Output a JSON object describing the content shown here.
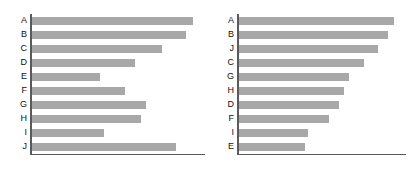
{
  "figure": {
    "background_color": "#ffffff",
    "bar_color": "#a8a8a8",
    "axis_color": "#5a5a5a",
    "label_color": "#111111",
    "panel_count": 2
  },
  "chart_data": [
    {
      "type": "bar",
      "orientation": "horizontal",
      "title": "",
      "subtitle": "",
      "xlabel": "",
      "ylabel": "",
      "legend": [],
      "legend_position": "none",
      "grid": false,
      "sorted": false,
      "sort_order": "category",
      "categories": [
        "A",
        "B",
        "C",
        "D",
        "E",
        "F",
        "G",
        "H",
        "I",
        "J"
      ],
      "values": [
        92.0,
        88.0,
        74.0,
        59.0,
        39.0,
        53.0,
        65.0,
        62.0,
        41.0,
        82.0
      ],
      "xlim": [
        0,
        100
      ],
      "ylim": [
        0,
        10
      ],
      "tick_labels_x": [],
      "tick_labels_y": [
        "A",
        "B",
        "C",
        "D",
        "E",
        "F",
        "G",
        "H",
        "I",
        "J"
      ],
      "annotations": []
    },
    {
      "type": "bar",
      "orientation": "horizontal",
      "title": "",
      "subtitle": "",
      "xlabel": "",
      "ylabel": "",
      "legend": [],
      "legend_position": "none",
      "grid": false,
      "sorted": true,
      "sort_order": "descending",
      "categories": [
        "A",
        "B",
        "J",
        "C",
        "G",
        "H",
        "D",
        "F",
        "I",
        "E"
      ],
      "values": [
        92.0,
        88.0,
        82.0,
        74.0,
        65.0,
        62.0,
        59.0,
        53.0,
        41.0,
        39.0
      ],
      "xlim": [
        0,
        100
      ],
      "ylim": [
        0,
        10
      ],
      "tick_labels_x": [],
      "tick_labels_y": [
        "A",
        "B",
        "J",
        "C",
        "G",
        "H",
        "D",
        "F",
        "I",
        "E"
      ],
      "annotations": []
    }
  ]
}
